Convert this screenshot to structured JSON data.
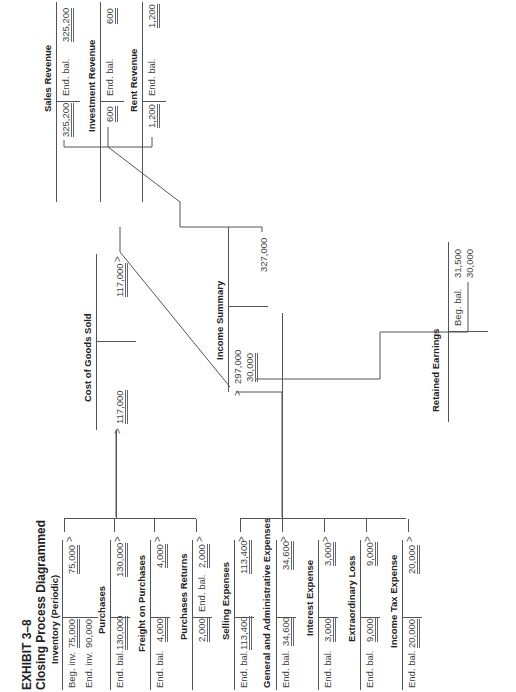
{
  "title": {
    "line1": "EXHIBIT 3–8",
    "line2": "Closing Process Diagrammed"
  },
  "accounts": {
    "inventory": {
      "name": "Inventory (Periodic)",
      "debits": [
        {
          "label": "Beg. inv.",
          "value": "75,000"
        },
        {
          "label": "End. inv.",
          "value": "90,000"
        }
      ],
      "credits": [
        {
          "label": "",
          "value": "75,000"
        }
      ]
    },
    "purchases": {
      "name": "Purchases",
      "debit_label": "End. bal.",
      "debit": "130,000",
      "credit": "130,000"
    },
    "freight": {
      "name": "Freight on Purchases",
      "debit_label": "End. bal.",
      "debit": "4,000",
      "credit": "4,000"
    },
    "purchases_returns": {
      "name": "Purchases Returns",
      "debit": "2,000",
      "credit_label": "End. bal.",
      "credit": "2,000"
    },
    "selling": {
      "name": "Selling Expenses",
      "debit_label": "End. bal.",
      "debit": "113,400",
      "credit": "113,400"
    },
    "gen_admin": {
      "name": "General and Administrative Expenses",
      "debit_label": "End. bal.",
      "debit": "34,600",
      "credit": "34,600"
    },
    "interest": {
      "name": "Interest Expense",
      "debit_label": "End. bal.",
      "debit": "3,000",
      "credit": "3,000"
    },
    "extraordinary": {
      "name": "Extraordinary Loss",
      "debit_label": "End. bal.",
      "debit": "9,000",
      "credit": "9,000"
    },
    "income_tax": {
      "name": "Income Tax Expense",
      "debit_label": "End. bal.",
      "debit": "20,000",
      "credit": "20,000"
    },
    "cogs": {
      "name": "Cost of Goods Sold",
      "debit": "117,000",
      "credit": "117,000"
    },
    "income_summary": {
      "name": "Income Summary",
      "debits": [
        "297,000",
        "30,000"
      ],
      "credit": "327,000"
    },
    "retained_earnings": {
      "name": "Retained Earnings",
      "credit_label": "Beg. bal.",
      "credits": [
        "31,500",
        "30,000"
      ]
    },
    "sales": {
      "name": "Sales Revenue",
      "debit": "325,200",
      "credit_label": "End. bal.",
      "credit": "325,200"
    },
    "investment": {
      "name": "Investment Revenue",
      "debit": "600",
      "credit_label": "End. bal.",
      "credit": "600"
    },
    "rent": {
      "name": "Rent Revenue",
      "debit": "1,200",
      "credit_label": "End. bal.",
      "credit": "1,200"
    }
  }
}
